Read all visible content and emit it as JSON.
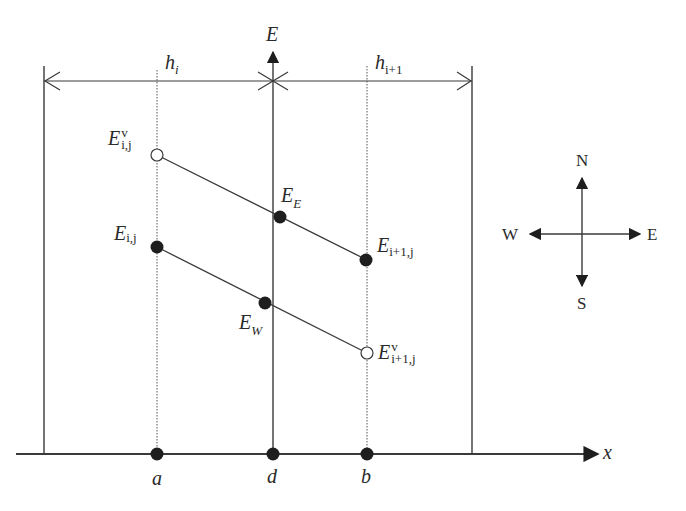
{
  "diagram": {
    "type": "finite-volume-grid-schematic",
    "colors": {
      "line": "#3a3a3a",
      "dot": "#1e1e1e",
      "background": "#ffffff"
    },
    "axes": {
      "vertical": {
        "label": "E"
      },
      "horizontal": {
        "label": "x"
      }
    },
    "spacings": {
      "left": {
        "symbol": "h",
        "subscript": "i"
      },
      "right": {
        "symbol": "h",
        "subscript": "i+1"
      }
    },
    "axis_points": [
      {
        "id": "a",
        "label": "a"
      },
      {
        "id": "d",
        "label": "d"
      },
      {
        "id": "b",
        "label": "b"
      }
    ],
    "nodes": [
      {
        "id": "Ev_ij",
        "symbol": "E",
        "superscript": "v",
        "subscript": "i,j",
        "marker": "open-circle"
      },
      {
        "id": "E_ij",
        "symbol": "E",
        "subscript": "i,j",
        "marker": "filled-circle"
      },
      {
        "id": "E_E",
        "symbol": "E",
        "subscript": "E",
        "marker": "filled-circle"
      },
      {
        "id": "E_W",
        "symbol": "E",
        "subscript": "W",
        "marker": "filled-circle"
      },
      {
        "id": "E_i1j",
        "symbol": "E",
        "subscript": "i+1,j",
        "marker": "filled-circle"
      },
      {
        "id": "Ev_i1j",
        "symbol": "E",
        "superscript": "v",
        "subscript": "i+1,j",
        "marker": "open-circle"
      }
    ],
    "compass": {
      "north": "N",
      "south": "S",
      "west": "W",
      "east": "E"
    }
  }
}
